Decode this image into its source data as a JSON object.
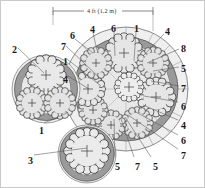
{
  "figure": {
    "dimension": {
      "label": "4 ft (1.2 m)",
      "x1": 52,
      "x2": 152,
      "y": 10
    },
    "colors": {
      "outline": "#2b2b2b",
      "canopy_fill": "#e8e8e8",
      "canopy_fill_light": "#efefef",
      "ring_gray": "#9a9a9a",
      "ring_gray_light": "#b9b9b9",
      "plate_fill": "#e2e2e2",
      "radial_line": "#8d8d8d",
      "leader_line": "#555555",
      "text": "#1a1a1a",
      "frame": "#c9c9c9",
      "background": "#ffffff"
    }
  },
  "callouts": [
    {
      "id": "c-6-topleft",
      "text": "6",
      "x": 69,
      "y": 30,
      "lx": 74,
      "ly": 38,
      "tx": 92,
      "ty": 52
    },
    {
      "id": "c-4-top",
      "text": "4",
      "x": 89,
      "y": 24,
      "lx": 92,
      "ly": 32,
      "tx": 96,
      "ty": 49
    },
    {
      "id": "c-6-top",
      "text": "6",
      "x": 110,
      "y": 23,
      "lx": 113,
      "ly": 31,
      "tx": 114,
      "ty": 55
    },
    {
      "id": "c-1-top",
      "text": "1",
      "x": 133,
      "y": 23,
      "lx": 135,
      "ly": 31,
      "tx": 133,
      "ty": 60
    },
    {
      "id": "c-4-topright",
      "text": "4",
      "x": 164,
      "y": 26,
      "lx": 163,
      "ly": 33,
      "tx": 142,
      "ty": 55
    },
    {
      "id": "c-8-right",
      "text": "8",
      "x": 180,
      "y": 43,
      "lx": 178,
      "ly": 48,
      "tx": 146,
      "ty": 62
    },
    {
      "id": "c-5-right",
      "text": "5",
      "x": 180,
      "y": 63,
      "lx": 178,
      "ly": 66,
      "tx": 152,
      "ty": 70
    },
    {
      "id": "c-7-right",
      "text": "7",
      "x": 180,
      "y": 83,
      "lx": 178,
      "ly": 85,
      "tx": 150,
      "ty": 80
    },
    {
      "id": "c-6-right",
      "text": "6",
      "x": 180,
      "y": 101,
      "lx": 177,
      "ly": 101,
      "tx": 143,
      "ty": 95
    },
    {
      "id": "c-4-right",
      "text": "4",
      "x": 180,
      "y": 120,
      "lx": 177,
      "ly": 119,
      "tx": 142,
      "ty": 104
    },
    {
      "id": "c-6-lowright",
      "text": "6",
      "x": 180,
      "y": 135,
      "lx": 177,
      "ly": 134,
      "tx": 133,
      "ty": 110
    },
    {
      "id": "c-7-lowright",
      "text": "7",
      "x": 180,
      "y": 150,
      "lx": 177,
      "ly": 148,
      "tx": 127,
      "ty": 114
    },
    {
      "id": "c-5-bottomR",
      "text": "5",
      "x": 152,
      "y": 161,
      "lx": 150,
      "ly": 156,
      "tx": 124,
      "ty": 116
    },
    {
      "id": "c-7-bottom",
      "text": "7",
      "x": 134,
      "y": 161,
      "lx": 133,
      "ly": 156,
      "tx": 120,
      "ty": 118
    },
    {
      "id": "c-5-bottom",
      "text": "5",
      "x": 114,
      "y": 161,
      "lx": 114,
      "ly": 156,
      "tx": 113,
      "ty": 118
    },
    {
      "id": "c-7-left",
      "text": "7",
      "x": 60,
      "y": 41,
      "lx": 65,
      "ly": 45,
      "tx": 104,
      "ty": 82
    },
    {
      "id": "c-1-left",
      "text": "1",
      "x": 62,
      "y": 56,
      "lx": 66,
      "ly": 58,
      "tx": 100,
      "ty": 85
    },
    {
      "id": "c-4-left",
      "text": "4",
      "x": 62,
      "y": 74,
      "lx": 67,
      "ly": 75,
      "tx": 88,
      "ty": 88
    },
    {
      "id": "c-2-cluster",
      "text": "2",
      "x": 11,
      "y": 44,
      "lx": 17,
      "ly": 47,
      "tx": 43,
      "ty": 72
    },
    {
      "id": "c-1-cluster",
      "text": "1",
      "x": 38,
      "y": 125,
      "lx": 43,
      "ly": 122,
      "tx": 66,
      "ty": 112
    },
    {
      "id": "c-3-cluster",
      "text": "3",
      "x": 27,
      "y": 155,
      "lx": 33,
      "ly": 154,
      "tx": 86,
      "ty": 147
    }
  ],
  "clusters": [
    {
      "id": "cluster-main",
      "name": "main-cluster",
      "cx": 125,
      "cy": 88,
      "outer_r": 62,
      "ring_outer_r": 52,
      "ring_inner_r": 44,
      "trees": [
        {
          "id": "t-main-n",
          "cx": 123,
          "cy": 52,
          "r": 17
        },
        {
          "id": "t-main-ne",
          "cx": 152,
          "cy": 62,
          "r": 13
        },
        {
          "id": "t-main-e",
          "cx": 155,
          "cy": 96,
          "r": 16
        },
        {
          "id": "t-main-se",
          "cx": 136,
          "cy": 122,
          "r": 13
        },
        {
          "id": "t-main-s",
          "cx": 110,
          "cy": 124,
          "r": 12
        },
        {
          "id": "t-main-sw",
          "cx": 92,
          "cy": 109,
          "r": 12
        },
        {
          "id": "t-main-w",
          "cx": 87,
          "cy": 88,
          "r": 14
        },
        {
          "id": "t-main-nw",
          "cx": 95,
          "cy": 62,
          "r": 13
        },
        {
          "id": "t-main-ctr",
          "cx": 128,
          "cy": 86,
          "r": 12
        }
      ]
    },
    {
      "id": "cluster-left",
      "name": "left-cluster",
      "cx": 45,
      "cy": 88,
      "outer_r": 36,
      "ring_outer_r": 31,
      "ring_inner_r": 25,
      "trees": [
        {
          "id": "t-left-top",
          "cx": 45,
          "cy": 74,
          "r": 17
        },
        {
          "id": "t-left-bl",
          "cx": 31,
          "cy": 102,
          "r": 13
        },
        {
          "id": "t-left-br",
          "cx": 59,
          "cy": 102,
          "r": 13
        }
      ]
    },
    {
      "id": "cluster-bottom",
      "name": "bottom-cluster",
      "cx": 86,
      "cy": 153,
      "outer_r": 30,
      "ring_outer_r": 27,
      "ring_inner_r": 21,
      "trees": [
        {
          "id": "t-bot-main",
          "cx": 86,
          "cy": 150,
          "r": 19
        }
      ]
    }
  ]
}
